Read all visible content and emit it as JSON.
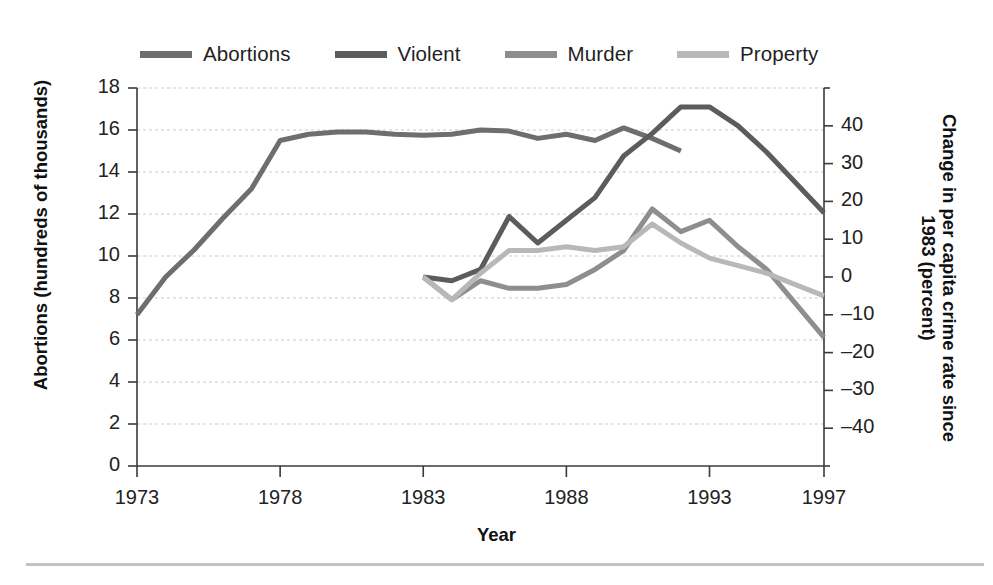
{
  "chart_data": {
    "type": "line",
    "title": "",
    "xlabel": "Year",
    "ylabel": "Abortions (hundreds of thousands)",
    "ylabel_right": "Change in per capita crime rate since 1983 (percent)",
    "grid": true,
    "legend_position": "top",
    "xlim": [
      1973,
      1997
    ],
    "xticks": [
      1973,
      1978,
      1983,
      1988,
      1993,
      1997
    ],
    "xtick_labels": [
      "1973",
      "1978",
      "1983",
      "1988",
      "1993",
      "1997"
    ],
    "ylim_left": [
      0,
      18
    ],
    "yticks_left": [
      0,
      2,
      4,
      6,
      8,
      10,
      12,
      14,
      16,
      18
    ],
    "ytick_labels_left": [
      "0",
      "2",
      "4",
      "6",
      "8",
      "10",
      "12",
      "14",
      "16",
      "18"
    ],
    "ylim_right": [
      -50,
      50
    ],
    "yticks_right": [
      -40,
      -30,
      -20,
      -10,
      0,
      10,
      20,
      30,
      40
    ],
    "ytick_labels_right": [
      "–40",
      "–30",
      "–20",
      "–10",
      "0",
      "10",
      "20",
      "30",
      "40"
    ],
    "series": [
      {
        "name": "Abortions",
        "axis": "left",
        "color": "#6e6e6e",
        "width": 5.0,
        "x": [
          1973,
          1974,
          1975,
          1976,
          1977,
          1978,
          1979,
          1980,
          1981,
          1982,
          1983,
          1984,
          1985,
          1986,
          1987,
          1988,
          1989,
          1990,
          1991,
          1992
        ],
        "values": [
          7.2,
          9.0,
          10.3,
          11.8,
          13.2,
          15.5,
          15.8,
          15.9,
          15.9,
          15.8,
          15.75,
          15.8,
          16.0,
          15.95,
          15.6,
          15.8,
          15.5,
          16.1,
          15.6,
          15.0
        ]
      },
      {
        "name": "Violent",
        "axis": "right",
        "color": "#5c5c5c",
        "width": 5.0,
        "x": [
          1983,
          1984,
          1985,
          1986,
          1987,
          1988,
          1989,
          1990,
          1991,
          1992,
          1993,
          1994,
          1995,
          1996,
          1997
        ],
        "values": [
          0,
          -1,
          2,
          16,
          9,
          15,
          21,
          32,
          38,
          45,
          45,
          40,
          33,
          25,
          17
        ]
      },
      {
        "name": "Murder",
        "axis": "right",
        "color": "#8e8e8e",
        "width": 5.0,
        "x": [
          1983,
          1984,
          1985,
          1986,
          1987,
          1988,
          1989,
          1990,
          1991,
          1992,
          1993,
          1994,
          1995,
          1996,
          1997
        ],
        "values": [
          0,
          -6,
          -1,
          -3,
          -3,
          -2,
          2,
          7,
          18,
          12,
          15,
          8,
          2,
          -7,
          -16
        ]
      },
      {
        "name": "Property",
        "axis": "right",
        "color": "#b8b8b8",
        "width": 5.0,
        "x": [
          1983,
          1984,
          1985,
          1986,
          1987,
          1988,
          1989,
          1990,
          1991,
          1992,
          1993,
          1994,
          1995,
          1996,
          1997
        ],
        "values": [
          0,
          -6,
          1,
          7,
          7,
          8,
          7,
          8,
          14,
          9,
          5,
          3,
          1,
          -2,
          -5
        ]
      }
    ]
  },
  "legend": {
    "items": [
      {
        "label": "Abortions",
        "color": "#6e6e6e"
      },
      {
        "label": "Violent",
        "color": "#5c5c5c"
      },
      {
        "label": "Murder",
        "color": "#8e8e8e"
      },
      {
        "label": "Property",
        "color": "#b8b8b8"
      }
    ]
  },
  "axis_titles": {
    "x": "Year",
    "y_left": "Abortions (hundreds of thousands)",
    "y_right": "Change in per capita crime rate since 1983 (percent)"
  }
}
